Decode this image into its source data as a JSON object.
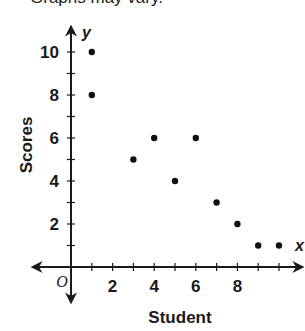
{
  "header": {
    "cutoff_text": "Graphs may vary."
  },
  "chart_data": {
    "type": "scatter",
    "title": "",
    "xlabel": "Student",
    "ylabel": "Scores",
    "x_axis_letter": "x",
    "y_axis_letter": "y",
    "origin_label": "O",
    "x_tick_labels": [
      "2",
      "4",
      "6",
      "8"
    ],
    "y_tick_labels": [
      "2",
      "4",
      "6",
      "8",
      "10"
    ],
    "xlim": [
      0,
      10
    ],
    "ylim": [
      0,
      10
    ],
    "grid": false,
    "points": [
      {
        "x": 1,
        "y": 10
      },
      {
        "x": 1,
        "y": 8
      },
      {
        "x": 3,
        "y": 5
      },
      {
        "x": 4,
        "y": 6
      },
      {
        "x": 5,
        "y": 4
      },
      {
        "x": 6,
        "y": 6
      },
      {
        "x": 7,
        "y": 3
      },
      {
        "x": 8,
        "y": 2
      },
      {
        "x": 9,
        "y": 1
      },
      {
        "x": 10,
        "y": 1
      }
    ],
    "colors": {
      "axis": "#1a1a1a",
      "points": "#111111"
    }
  }
}
